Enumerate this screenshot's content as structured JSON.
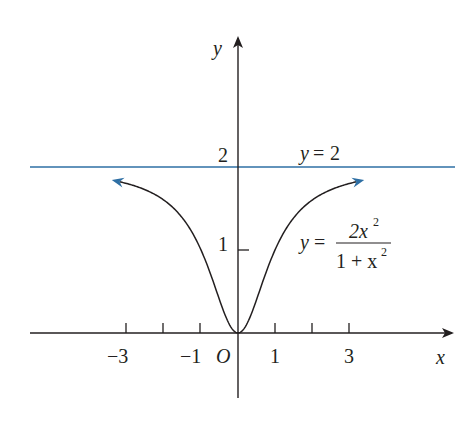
{
  "chart_data": {
    "type": "line",
    "title": "",
    "xlabel": "x",
    "ylabel": "y",
    "origin_label": "O",
    "x_ticks": [
      -3,
      -2,
      -1,
      1,
      2,
      3
    ],
    "x_tick_labels": [
      "−3",
      "−1",
      "1",
      "3"
    ],
    "y_tick_labels": [
      "1",
      "2"
    ],
    "xlim": [
      -5.5,
      5.9
    ],
    "ylim": [
      -0.8,
      3.7
    ],
    "grid": false,
    "series": [
      {
        "name": "y = 2x²/(1+x²)",
        "function": "2*x^2/(1+x^2)",
        "domain": [
          -3.2,
          3.2
        ],
        "color": "#231f20",
        "arrows": "both",
        "arrow_color": "#2e6fa4"
      },
      {
        "name": "y = 2",
        "function": "2",
        "domain": [
          -5.5,
          5.9
        ],
        "color": "#2e6fa4"
      }
    ],
    "annotations": [
      {
        "text": "y = 2",
        "x": 2.6,
        "y": 2.15
      },
      {
        "text": "y = 2x²/(1+x²)",
        "x": 2.7,
        "y": 1.15
      }
    ]
  },
  "labels": {
    "x_axis": "x",
    "y_axis": "y",
    "origin": "O",
    "tick_neg3": "−3",
    "tick_neg1": "−1",
    "tick_pos1": "1",
    "tick_pos3": "3",
    "tick_y1": "1",
    "tick_y2": "2",
    "asymptote_y": "y",
    "asymptote_eq": "=",
    "asymptote_val": "2",
    "func_y": "y",
    "func_eq": "=",
    "func_num": "2x",
    "func_num_exp": "2",
    "func_den": "1 + x",
    "func_den_exp": "2"
  },
  "colors": {
    "axis": "#231f20",
    "curve": "#231f20",
    "asymptote": "#2e6fa4",
    "arrowhead": "#2e6fa4"
  }
}
